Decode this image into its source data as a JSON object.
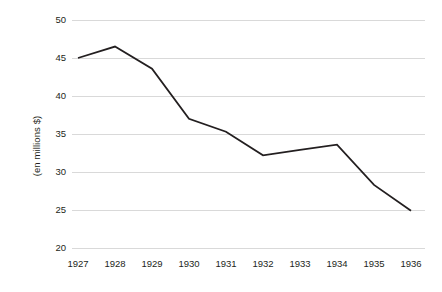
{
  "chart_data": {
    "type": "line",
    "title": "",
    "subtitle": "",
    "xlabel": "",
    "ylabel": "(en millions $)",
    "categories": [
      "1927",
      "1928",
      "1929",
      "1930",
      "1931",
      "1932",
      "1933",
      "1934",
      "1935",
      "1936"
    ],
    "values": [
      45.0,
      46.5,
      43.6,
      37.0,
      35.3,
      32.2,
      32.9,
      33.6,
      28.3,
      24.9
    ],
    "series": [
      {
        "name": "",
        "values": [
          45.0,
          46.5,
          43.6,
          37.0,
          35.3,
          32.2,
          32.9,
          33.6,
          28.3,
          24.9
        ]
      }
    ],
    "ylim": [
      20,
      50
    ],
    "yticks": [
      20,
      25,
      30,
      35,
      40,
      45,
      50
    ],
    "ytick_labels": [
      "20",
      "25",
      "30",
      "35",
      "40",
      "45",
      "50"
    ],
    "xlim": [
      "1927",
      "1936"
    ],
    "grid": "horizontal",
    "legend": "none",
    "line_color": "#231f20",
    "line_width": 1.8,
    "gridline_color": "#d9d9d9",
    "background_color": "#ffffff",
    "text_color": "#231f20",
    "markers": "none",
    "annotations": []
  }
}
